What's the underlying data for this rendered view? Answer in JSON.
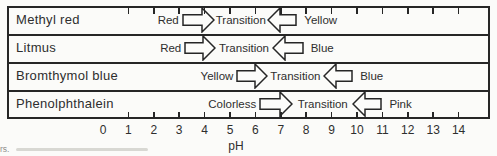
{
  "colors": {
    "background": "#fbfbf9",
    "line": "#262626",
    "text": "#2e2e2e",
    "arrow_fill": "#fcfcfa",
    "caption": "#8f8f8c",
    "smudge": "#d8d8d3"
  },
  "indicator_chart": {
    "rows": [
      {
        "indicator": "Methyl red",
        "acid_color_label": "Red",
        "transition_label": "Transition",
        "base_color_label": "Yellow",
        "acid_arrow_ph": [
          3.1,
          4.4
        ],
        "base_arrow_ph": [
          6.45,
          7.65
        ]
      },
      {
        "indicator": "Litmus",
        "acid_color_label": "Red",
        "transition_label": "Transition",
        "base_color_label": "Blue",
        "acid_arrow_ph": [
          3.2,
          4.45
        ],
        "base_arrow_ph": [
          6.65,
          7.9
        ]
      },
      {
        "indicator": "Bromthymol blue",
        "acid_color_label": "Yellow",
        "transition_label": "Transition",
        "base_color_label": "Blue",
        "acid_arrow_ph": [
          5.25,
          6.5
        ],
        "base_arrow_ph": [
          8.65,
          9.85
        ]
      },
      {
        "indicator": "Phenolphthalein",
        "acid_color_label": "Colorless",
        "transition_label": "Transition",
        "base_color_label": "Pink",
        "acid_arrow_ph": [
          6.15,
          7.5
        ],
        "base_arrow_ph": [
          9.8,
          11.0
        ]
      }
    ],
    "axis": {
      "label": "pH",
      "numbers": [
        "0",
        "1",
        "2",
        "3",
        "4",
        "5",
        "6",
        "7",
        "8",
        "9",
        "10",
        "11",
        "12",
        "13",
        "14"
      ],
      "tick_values": [
        1,
        2,
        3,
        4,
        5,
        6,
        7,
        8,
        9,
        10,
        11,
        12,
        13,
        14
      ],
      "range": [
        0,
        14
      ]
    }
  },
  "caption_fragment": "rs."
}
